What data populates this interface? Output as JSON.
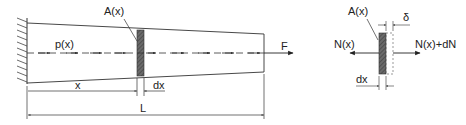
{
  "colors": {
    "line": "#333333",
    "shade": "#555555",
    "background": "#ffffff"
  },
  "main_figure": {
    "section_label": "A(x)",
    "load_label": "p(x)",
    "force_label": "F",
    "dim_x_label": "x",
    "dim_dx_label": "dx",
    "dim_L_label": "L"
  },
  "element_figure": {
    "section_label": "A(x)",
    "delta_label": "δ",
    "left_force_label": "N(x)",
    "right_force_label": "N(x)+dN",
    "dim_dx_label": "dx"
  }
}
